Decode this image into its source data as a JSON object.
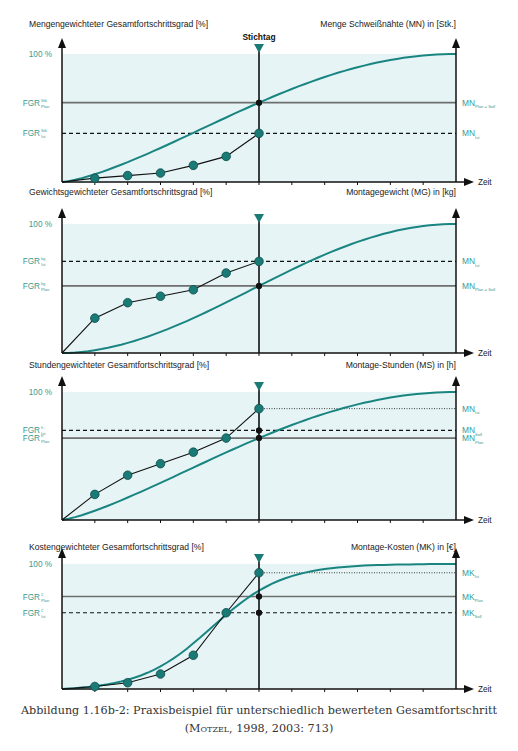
{
  "header_fragment": "",
  "stichtag_label": "Stichtag",
  "x_axis_label": "Zeit",
  "colors": {
    "plan_curve": "#1a8580",
    "marker": "#1a7a75",
    "label_teal": "#3a9a92",
    "panel_bg": "#e6f4f6",
    "axis": "#111111",
    "grey_line": "#6e6e6e"
  },
  "caption": {
    "line1": "Abbildung 1.16b-2: Praxisbeispiel für unterschiedlich bewerteten Gesamtfortschritt",
    "line2_author": "Motzel",
    "line2_rest": ", 1998, 2003: 713)",
    "line2_open": "("
  },
  "chart_data": [
    {
      "type": "line",
      "title": "Mengengewichteter Gesamtfortschrittsgrad [%]",
      "ylabel_left": "Mengengewichteter Gesamtfortschrittsgrad [%]",
      "ylabel_right": "Menge Schweißnähte (MN) in [Stk.]",
      "xlabel": "Zeit",
      "y_top_label": "100 %",
      "stichtag_index": 6,
      "left_labels": [
        {
          "text": "FGR",
          "sup": "Stk",
          "sub": "Plan",
          "style": "solid",
          "value": 0.62
        },
        {
          "text": "FGR",
          "sup": "Stk",
          "sub": "Ist",
          "style": "dashed",
          "value": 0.38
        }
      ],
      "right_labels": [
        {
          "text": "MN",
          "sub": "Plan = Soll",
          "style": "solid",
          "value": 0.62
        },
        {
          "text": "MN",
          "sub": "Ist",
          "style": "dashed",
          "value": 0.38
        }
      ],
      "series": [
        {
          "name": "Plan (S-Kurve)",
          "x": [
            0,
            6,
            12
          ],
          "values": [
            0,
            0.62,
            1.0
          ]
        },
        {
          "name": "Ist",
          "x": [
            0,
            1,
            2,
            3,
            4,
            5,
            6
          ],
          "values": [
            0,
            0.03,
            0.05,
            0.07,
            0.13,
            0.2,
            0.38
          ]
        }
      ]
    },
    {
      "type": "line",
      "title": "Gewichtsgewichteter Gesamtfortschrittsgrad [%]",
      "ylabel_left": "Gewichtsgewichteter Gesamtfortschrittsgrad [%]",
      "ylabel_right": "Montagegewicht (MG) in [kg]",
      "xlabel": "Zeit",
      "y_top_label": "100 %",
      "stichtag_index": 6,
      "left_labels": [
        {
          "text": "FGR",
          "sup": "kg",
          "sub": "Ist",
          "style": "dashed",
          "value": 0.71
        },
        {
          "text": "FGR",
          "sup": "kg",
          "sub": "Plan",
          "style": "solid",
          "value": 0.52
        }
      ],
      "right_labels": [
        {
          "text": "MN",
          "sub": "Ist",
          "style": "dashed",
          "value": 0.71
        },
        {
          "text": "MN",
          "sub": "Plan = Soll",
          "style": "solid",
          "value": 0.52
        }
      ],
      "series": [
        {
          "name": "Plan (S-Kurve)",
          "x": [
            0,
            6,
            12
          ],
          "values": [
            0,
            0.52,
            1.0
          ]
        },
        {
          "name": "Ist",
          "x": [
            0,
            1,
            2,
            3,
            4,
            5,
            6
          ],
          "values": [
            0,
            0.27,
            0.39,
            0.44,
            0.49,
            0.62,
            0.71
          ]
        }
      ]
    },
    {
      "type": "line",
      "title": "Stundengewichteter Gesamtfortschrittsgrad [%]",
      "ylabel_left": "Stundengewichteter Gesamtfortschrittsgrad [%]",
      "ylabel_right": "Montage-Stunden (MS) in [h]",
      "xlabel": "Zeit",
      "y_top_label": "100 %",
      "stichtag_index": 6,
      "left_labels": [
        {
          "text": "FGR",
          "sup": "h",
          "sub": "Ist",
          "style": "dashed",
          "value": 0.7
        },
        {
          "text": "FGR",
          "sup": "h",
          "sub": "Plan",
          "style": "solid",
          "value": 0.64
        }
      ],
      "right_labels": [
        {
          "text": "MN",
          "sub": "Ist",
          "style": "dotted",
          "value": 0.87
        },
        {
          "text": "MN",
          "sub": "Soll",
          "style": "dashed",
          "value": 0.7
        },
        {
          "text": "MN",
          "sub": "Plan",
          "style": "solid",
          "value": 0.64
        }
      ],
      "series": [
        {
          "name": "Plan (S-Kurve)",
          "x": [
            0,
            6,
            12
          ],
          "values": [
            0,
            0.64,
            1.0
          ]
        },
        {
          "name": "Ist",
          "x": [
            0,
            1,
            2,
            3,
            4,
            5,
            6
          ],
          "values": [
            0,
            0.2,
            0.35,
            0.44,
            0.53,
            0.64,
            0.87
          ]
        }
      ]
    },
    {
      "type": "line",
      "title": "Kostengewichteter Gesamtfortschrittsgrad [%]",
      "ylabel_left": "Kostengewichteter Gesamtfortschrittsgrad [%]",
      "ylabel_right": "Montage-Kosten (MK) in [€]",
      "xlabel": "Zeit",
      "y_top_label": "100 %",
      "stichtag_index": 6,
      "left_labels": [
        {
          "text": "FGR",
          "sup": "€",
          "sub": "Plan",
          "style": "solid",
          "value": 0.74
        },
        {
          "text": "FGR",
          "sup": "€",
          "sub": "Ist",
          "style": "dashed",
          "value": 0.61
        }
      ],
      "right_labels": [
        {
          "text": "MK",
          "sub": "Ist",
          "style": "dotted",
          "value": 0.93
        },
        {
          "text": "MK",
          "sub": "Plan",
          "style": "solid",
          "value": 0.74
        },
        {
          "text": "MK",
          "sub": "Soll",
          "style": "dashed",
          "value": 0.61
        }
      ],
      "series": [
        {
          "name": "Plan (S-Kurve)",
          "x": [
            0,
            6,
            12
          ],
          "values": [
            0,
            0.74,
            1.0
          ]
        },
        {
          "name": "Ist",
          "x": [
            0,
            1,
            2,
            3,
            4,
            5,
            6
          ],
          "values": [
            0,
            0.02,
            0.05,
            0.12,
            0.27,
            0.61,
            0.93
          ]
        }
      ]
    }
  ]
}
